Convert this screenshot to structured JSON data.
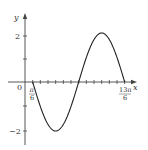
{
  "chart_data": {
    "type": "line",
    "title": "",
    "function": "y = -2 sin(x - π/6)",
    "xlabel": "x",
    "ylabel": "y",
    "x_tick_labels": [
      "π/6",
      "13π/6"
    ],
    "y_tick_labels": [
      "2",
      "-2"
    ],
    "origin_label": "0",
    "xlim": [
      "0",
      "13π/6"
    ],
    "ylim": [
      -2.5,
      2.5
    ],
    "tick_step": "π/6",
    "series": [
      {
        "name": "curve",
        "x": [
          "π/6",
          "2π/3",
          "7π/6",
          "5π/3",
          "13π/6"
        ],
        "x_numeric": [
          0.5236,
          2.0944,
          3.6652,
          5.236,
          6.8068
        ],
        "values": [
          0,
          -2,
          0,
          2,
          0
        ]
      }
    ],
    "grid": false,
    "legend": null
  },
  "labels": {
    "x_axis": "x",
    "y_axis": "y",
    "origin": "0",
    "y_pos": "2",
    "y_neg": "−2",
    "pi6_num": "π",
    "pi6_den": "6",
    "end_num": "13π",
    "end_den": "6"
  }
}
